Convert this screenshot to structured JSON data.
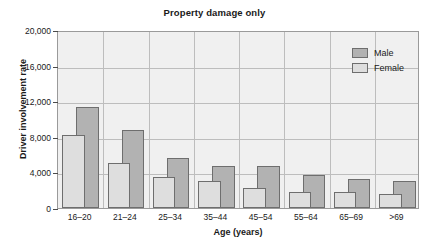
{
  "chart_data": {
    "type": "bar",
    "title": "Property damage only",
    "xlabel": "Age (years)",
    "ylabel": "Driver involvement rate",
    "categories": [
      "16–20",
      "21–24",
      "25–34",
      "35–44",
      "45–54",
      "55–64",
      "65–69",
      ">69"
    ],
    "series": [
      {
        "name": "Male",
        "color": "#b2b2b2",
        "values": [
          11350,
          8800,
          5600,
          4750,
          4750,
          3700,
          3300,
          3000
        ]
      },
      {
        "name": "Female",
        "color": "#dedede",
        "values": [
          8180,
          5050,
          3450,
          3000,
          2300,
          1800,
          1800,
          1550
        ]
      }
    ],
    "ylim": [
      0,
      20000
    ],
    "ytick_labels": [
      "20,000",
      "16,000",
      "12,000",
      "8,000",
      "4,000",
      "0"
    ],
    "ytick_values": [
      20000,
      16000,
      12000,
      8000,
      4000,
      0
    ],
    "grid": "horizontal-and-vertical",
    "legend_position": "top-right-inside",
    "bar_style": "overlapping",
    "plot_background": "#f0f0f0",
    "gridline_color": "#bdbdbd",
    "axis_color": "#9a9a9a"
  }
}
